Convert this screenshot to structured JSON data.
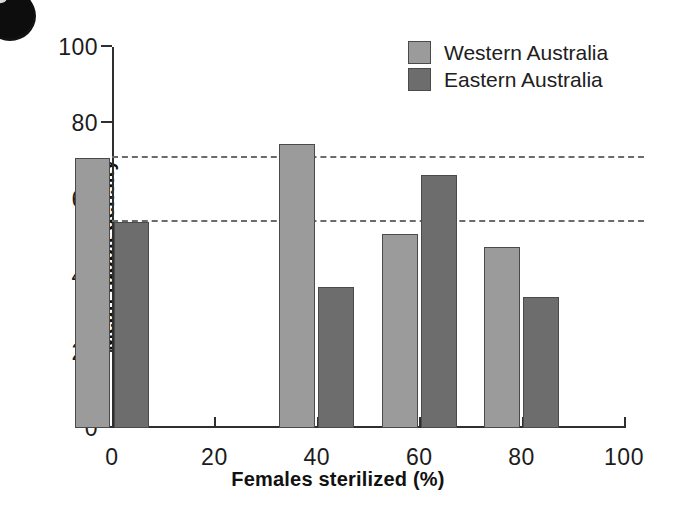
{
  "figure": {
    "background_color": "#ffffff",
    "artifact": "black-ink-blob-top-left"
  },
  "legend": {
    "position": "top-right",
    "entries": [
      {
        "label": "Western Australia",
        "color": "#9b9b9b",
        "swatch_name": "legend-swatch-western"
      },
      {
        "label": "Eastern Australia",
        "color": "#6d6d6d",
        "swatch_name": "legend-swatch-eastern"
      }
    ]
  },
  "axes": {
    "x_title": "Females sterilized (%)",
    "y_title": "Mean rabbit density",
    "x_ticks": [
      "0",
      "20",
      "40",
      "60",
      "80",
      "100"
    ],
    "y_ticks": [
      "0",
      "20",
      "40",
      "60",
      "80",
      "100"
    ]
  },
  "chart_data": {
    "type": "bar",
    "title": "",
    "subtitle": "",
    "xlabel": "Females sterilized (%)",
    "ylabel": "Mean rabbit density",
    "categories": [
      "0",
      "40",
      "60",
      "80"
    ],
    "category_values": [
      0,
      40,
      60,
      80
    ],
    "series": [
      {
        "name": "Western Australia",
        "color": "#9b9b9b",
        "values": [
          71,
          74.5,
          51,
          47.5
        ]
      },
      {
        "name": "Eastern Australia",
        "color": "#6d6d6d",
        "values": [
          54,
          37,
          66.5,
          34.5
        ]
      }
    ],
    "xlim": [
      0,
      100
    ],
    "ylim": [
      0,
      100
    ],
    "xticks": [
      0,
      20,
      40,
      60,
      80,
      100
    ],
    "yticks": [
      0,
      20,
      40,
      60,
      80,
      100
    ],
    "grid": false,
    "legend_position": "top-right",
    "annotations": [
      {
        "type": "reference-line",
        "name": "western-baseline-reference",
        "style": "dashed",
        "orientation": "horizontal",
        "y": 71,
        "color": "#6b6b6b"
      },
      {
        "type": "reference-line",
        "name": "eastern-baseline-reference",
        "style": "dashed",
        "orientation": "horizontal",
        "y": 54,
        "color": "#6b6b6b"
      }
    ],
    "bar_geometry": {
      "bar_width_units": 7,
      "group_gap_units": 0.6
    }
  }
}
